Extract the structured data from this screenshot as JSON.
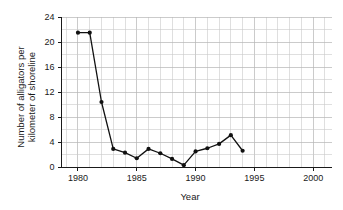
{
  "chart_data": {
    "type": "line",
    "title": "",
    "subtitle": "",
    "xlabel": "Year",
    "ylabel": "Number of alligators per kilometer of shoreline",
    "ylabel_line1": "Number of alligators per",
    "ylabel_line2": "kilometer of shoreline",
    "xlim": [
      1978.6,
      2001.6
    ],
    "ylim": [
      0,
      24
    ],
    "grid": true,
    "grid_x_step": 1,
    "grid_y_step": 2,
    "legend": "none",
    "xticks": [
      1980,
      1985,
      1990,
      1995,
      2000
    ],
    "xtick_labels": [
      "1980",
      "1985",
      "1990",
      "1995",
      "2000"
    ],
    "yticks": [
      0,
      4,
      8,
      12,
      16,
      20,
      24
    ],
    "ytick_labels": [
      "0",
      "4",
      "8",
      "12",
      "16",
      "20",
      "24"
    ],
    "x": [
      1980,
      1981,
      1982,
      1983,
      1984,
      1985,
      1986,
      1987,
      1988,
      1989,
      1990,
      1991,
      1992,
      1993,
      1994
    ],
    "values": [
      21.5,
      21.5,
      10.4,
      2.9,
      2.3,
      1.4,
      2.9,
      2.2,
      1.3,
      0.3,
      2.5,
      3.0,
      3.7,
      5.1,
      2.6
    ],
    "series": [
      {
        "name": "Alligators per km of shoreline",
        "marker": "circle",
        "color": "#111111",
        "values": [
          21.5,
          21.5,
          10.4,
          2.9,
          2.3,
          1.4,
          2.9,
          2.2,
          1.3,
          0.3,
          2.5,
          3.0,
          3.7,
          5.1,
          2.6
        ]
      }
    ],
    "colors": {
      "line": "#111111",
      "marker": "#111111",
      "grid": "#c9c9c9",
      "axis": "#1a1a1a",
      "background": "#ffffff"
    }
  }
}
